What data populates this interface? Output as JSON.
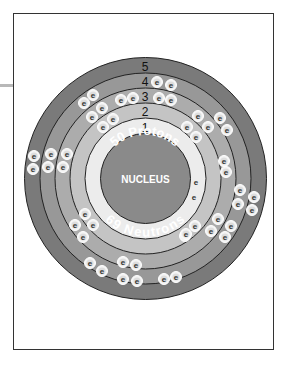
{
  "diagram": {
    "nucleus": {
      "label": "NUCLEUS",
      "protons_label": "50 Protons",
      "neutrons_label": "69 Neutrons",
      "color": "#8a8a8a"
    },
    "shells": [
      {
        "number": "1",
        "electron_count": 2,
        "color": "#ececec"
      },
      {
        "number": "2",
        "electron_count": 8,
        "color": "#c4c4c4"
      },
      {
        "number": "3",
        "electron_count": 18,
        "color": "#acacac"
      },
      {
        "number": "4",
        "electron_count": 18,
        "color": "#989898"
      },
      {
        "number": "5",
        "electron_count": 4,
        "color": "#7a7a7a"
      }
    ],
    "electron_symbol": "e"
  },
  "electrons": [
    [
      157,
      82
    ],
    [
      171,
      85
    ],
    [
      121,
      100
    ],
    [
      133,
      98
    ],
    [
      159,
      98
    ],
    [
      171,
      100
    ],
    [
      84,
      103
    ],
    [
      93,
      95
    ],
    [
      92,
      117
    ],
    [
      102,
      108
    ],
    [
      103,
      127
    ],
    [
      113,
      119
    ],
    [
      198,
      116
    ],
    [
      187,
      127
    ],
    [
      208,
      127
    ],
    [
      196,
      137
    ],
    [
      220,
      118
    ],
    [
      227,
      130
    ],
    [
      224,
      161
    ],
    [
      226,
      172
    ],
    [
      240,
      190
    ],
    [
      238,
      204
    ],
    [
      254,
      197
    ],
    [
      252,
      210
    ],
    [
      218,
      219
    ],
    [
      231,
      226
    ],
    [
      195,
      226
    ],
    [
      211,
      231
    ],
    [
      225,
      237
    ],
    [
      185,
      236
    ],
    [
      186,
      234
    ],
    [
      34,
      156
    ],
    [
      33,
      169
    ],
    [
      51,
      154
    ],
    [
      48,
      167
    ],
    [
      67,
      154
    ],
    [
      63,
      167
    ],
    [
      85,
      214
    ],
    [
      75,
      225
    ],
    [
      93,
      225
    ],
    [
      83,
      237
    ],
    [
      90,
      263
    ],
    [
      102,
      271
    ],
    [
      123,
      262
    ],
    [
      136,
      265
    ],
    [
      123,
      279
    ],
    [
      137,
      281
    ],
    [
      164,
      279
    ],
    [
      176,
      277
    ]
  ],
  "shell1_electrons": [
    [
      196,
      182
    ],
    [
      194,
      197
    ]
  ]
}
